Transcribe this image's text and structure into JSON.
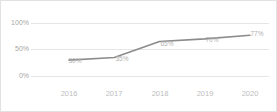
{
  "chart_data": {
    "type": "line",
    "title": "",
    "subtitle": "",
    "xlabel": "",
    "ylabel": "",
    "categories": [
      "2016",
      "2017",
      "2018",
      "2019",
      "2020"
    ],
    "values": [
      30,
      35,
      65,
      70,
      77
    ],
    "point_labels": [
      "30%",
      "35%",
      "65%",
      "70%",
      "77%"
    ],
    "ylim": [
      0,
      100
    ],
    "ytick_values": [
      0,
      50,
      100
    ],
    "ytick_labels": [
      "0%",
      "50%",
      "100%"
    ],
    "grid": true,
    "legend": "none",
    "series": [
      {
        "name": "",
        "values": [
          30,
          35,
          65,
          70,
          77
        ]
      }
    ],
    "colors": {
      "line": "#8c8c8c",
      "gridline": "#e6e6e6",
      "axis_text": "#a6a6a6",
      "category_text": "#bdbdbd",
      "label_text": "#b0b0b0",
      "background": "#ffffff",
      "border": "#e2e2e2"
    }
  }
}
